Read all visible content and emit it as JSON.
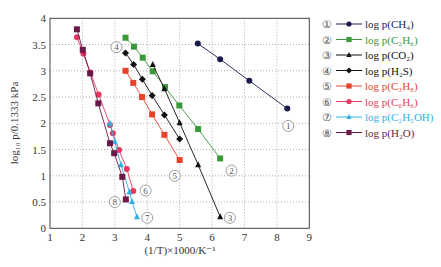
{
  "chart_data": {
    "type": "line",
    "title": "",
    "xlabel": "(1/T)×1000/K⁻¹",
    "ylabel": "log₁₀ p/0.1333 kPa",
    "xlim": [
      1,
      9
    ],
    "ylim": [
      0,
      4
    ],
    "xticks": [
      "1",
      "2",
      "3",
      "4",
      "5",
      "6",
      "7",
      "8",
      "9"
    ],
    "yticks": [
      "0",
      "0.5",
      "1",
      "1.5",
      "2",
      "2.5",
      "3",
      "3.5",
      "4"
    ],
    "grid": true,
    "legend_position": "right",
    "series": [
      {
        "id": "1",
        "name": "log p(CH₄)",
        "color": "#1a1a4e",
        "marker": "circle",
        "x": [
          5.56,
          6.25,
          7.15,
          8.32
        ],
        "y": [
          3.52,
          3.22,
          2.81,
          2.28
        ],
        "label_at": [
          8.35,
          1.95
        ]
      },
      {
        "id": "2",
        "name": "log p(C₂H₆)",
        "color": "#3a9a3a",
        "marker": "square",
        "x": [
          3.33,
          3.59,
          3.86,
          4.17,
          4.55,
          4.99,
          5.57,
          6.25
        ],
        "y": [
          3.63,
          3.46,
          3.25,
          2.99,
          2.69,
          2.34,
          1.89,
          1.33
        ],
        "label_at": [
          6.6,
          1.1
        ]
      },
      {
        "id": "3",
        "name": "log p(CO₂)",
        "color": "#111111",
        "marker": "triangle",
        "x": [
          4.17,
          4.53,
          5.0,
          5.57,
          6.25
        ],
        "y": [
          3.12,
          2.66,
          2.01,
          1.21,
          0.22
        ],
        "label_at": [
          6.55,
          0.2
        ]
      },
      {
        "id": "4",
        "name": "log p(H₂S)",
        "color": "#111111",
        "marker": "diamond",
        "x": [
          3.33,
          3.58,
          3.85,
          4.15,
          4.53,
          5.0
        ],
        "y": [
          3.34,
          3.12,
          2.84,
          2.53,
          2.16,
          1.7
        ],
        "label_at": [
          3.05,
          3.45
        ]
      },
      {
        "id": "5",
        "name": "log p(C₃H₈)",
        "color": "#e8422a",
        "marker": "square",
        "x": [
          3.33,
          3.57,
          3.84,
          4.15,
          4.53,
          5.0
        ],
        "y": [
          3.0,
          2.77,
          2.5,
          2.17,
          1.78,
          1.3
        ],
        "label_at": [
          4.85,
          1.0
        ]
      },
      {
        "id": "6",
        "name": "log p(C₆H₆)",
        "color": "#e83860",
        "marker": "circle",
        "x": [
          1.83,
          2.03,
          2.24,
          2.5,
          2.85,
          2.94,
          3.13,
          3.37,
          3.57
        ],
        "y": [
          3.64,
          3.33,
          2.97,
          2.55,
          1.97,
          1.81,
          1.49,
          1.13,
          0.71
        ],
        "label_at": [
          3.95,
          0.72
        ]
      },
      {
        "id": "7",
        "name": "log p(C₂H₅OH)",
        "color": "#35b0e0",
        "marker": "triangle",
        "x": [
          2.85,
          3.0,
          3.19,
          3.45,
          3.53,
          3.68
        ],
        "y": [
          2.0,
          1.65,
          1.21,
          0.69,
          0.51,
          0.22
        ],
        "label_at": [
          4.0,
          0.2
        ]
      },
      {
        "id": "8",
        "name": "log p(H₂O)",
        "color": "#6a1a48",
        "marker": "square",
        "x": [
          1.83,
          2.01,
          2.24,
          2.49,
          2.85,
          2.98,
          3.23,
          3.34
        ],
        "y": [
          3.79,
          3.4,
          2.95,
          2.38,
          1.62,
          1.43,
          0.98,
          0.55
        ],
        "label_at": [
          3.0,
          0.5
        ]
      }
    ]
  },
  "legend": {
    "items": [
      {
        "num": "①",
        "text": "log p(CH₄)",
        "color": "#1a1a4e"
      },
      {
        "num": "②",
        "text": "log p(C₂H₆)",
        "color": "#3a9a3a"
      },
      {
        "num": "③",
        "text": "log p(CO₂)",
        "color": "#111111"
      },
      {
        "num": "④",
        "text": "log p(H₂S)",
        "color": "#111111"
      },
      {
        "num": "⑤",
        "text": "log p(C₃H₈)",
        "color": "#e8422a"
      },
      {
        "num": "⑥",
        "text": "log p(C₆H₆)",
        "color": "#e83860"
      },
      {
        "num": "⑦",
        "text": "log p(C₂H₅OH)",
        "color": "#35b0e0"
      },
      {
        "num": "⑧",
        "text": "log p(H₂O)",
        "color": "#6a1a48"
      }
    ]
  }
}
